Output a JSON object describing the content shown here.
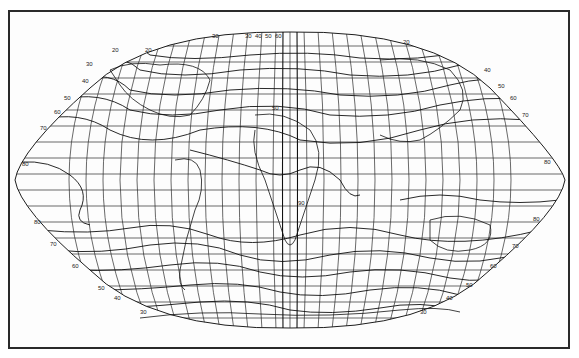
{
  "map": {
    "projection": "world-elliptical",
    "frame_color": "#2a2a2a",
    "line_color": "#1e1e1e",
    "isoline_labels": {
      "north_west": [
        "30",
        "40",
        "50",
        "60",
        "70"
      ],
      "north_top": [
        "20",
        "30",
        "30",
        "40",
        "50",
        "60",
        "20"
      ],
      "north_east": [
        "40",
        "50",
        "60",
        "70",
        "80"
      ],
      "equator_west": "80",
      "equator_east": "80",
      "south_west": [
        "80",
        "70",
        "60",
        "50",
        "40",
        "30"
      ],
      "south_east": [
        "80",
        "70",
        "60",
        "50",
        "40",
        "30"
      ],
      "inland": [
        "50",
        "90",
        "20"
      ]
    }
  }
}
